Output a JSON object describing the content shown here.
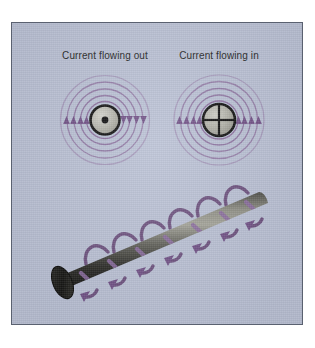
{
  "figure": {
    "kind": "physics-diagram",
    "panel": {
      "background_color": "#b9c0d4",
      "border_color": "#5a6170"
    }
  },
  "labels": {
    "current_out": "Current flowing out",
    "current_in": "Current flowing in"
  },
  "colors": {
    "field_line": "#7b5f8c",
    "field_line_light": "#a98fb8",
    "arrow": "#6f4f85",
    "conductor_fill": "#b0b0a8",
    "conductor_stroke": "#111111",
    "wire_dark": "#1d1d1d",
    "wire_light": "#8f8f86",
    "text": "#1b1c20",
    "panel_bg": "#b9c0d4",
    "panel_border": "#5a6170",
    "page_bg": "#ffffff"
  },
  "cross_sections": [
    {
      "name": "current-out-of-page",
      "symbol": "dot",
      "symbol_meaning": "current directed out of the page",
      "label": "Current flowing out",
      "field_ring_count": 4,
      "circulation": "counterclockwise",
      "left_arrow_direction": "up",
      "right_arrow_direction": "down",
      "arrows_per_side": 4
    },
    {
      "name": "current-into-page",
      "symbol": "cross",
      "symbol_meaning": "current directed into the page",
      "label": "Current flowing in",
      "field_ring_count": 4,
      "circulation": "clockwise",
      "left_arrow_direction": "up",
      "right_arrow_direction": "up",
      "arrows_per_side": 4
    }
  ],
  "wire": {
    "name": "current-carrying-wire",
    "orientation": "diagonal-lower-left-to-upper-right",
    "field_loop_count": 7,
    "loop_arrow_direction": "down",
    "end_cap": "visible-ellipse-at-lower-left"
  }
}
